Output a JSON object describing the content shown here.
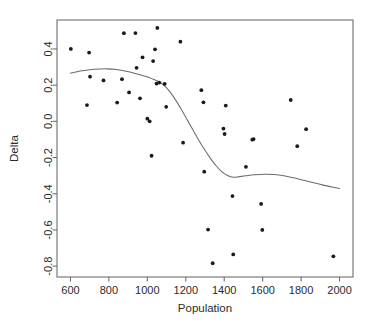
{
  "chart_data": {
    "type": "scatter",
    "title": "",
    "xlabel": "Population",
    "ylabel": "Delta",
    "xlim": [
      530,
      2070
    ],
    "ylim": [
      -0.86,
      0.56
    ],
    "grid": false,
    "legend": null,
    "xticks": [
      600,
      800,
      1000,
      1200,
      1400,
      1600,
      1800,
      2000
    ],
    "xtick_labels": [
      "600",
      "800",
      "1000",
      "1200",
      "1400",
      "1600",
      "1800",
      "2000"
    ],
    "yticks": [
      0.4,
      0.2,
      0.0,
      -0.2,
      -0.4,
      -0.6,
      -0.8
    ],
    "ytick_labels": [
      "0.4",
      "0.2",
      "0.0",
      "-0.2",
      "-0.4",
      "-0.6",
      "-0.8"
    ],
    "point_color": "#1a1a1a",
    "curve_color": "#6b6b6b",
    "frame_color": "#6e6e6e",
    "points": [
      {
        "x": 602,
        "y": 0.4
      },
      {
        "x": 686,
        "y": 0.09
      },
      {
        "x": 697,
        "y": 0.38
      },
      {
        "x": 702,
        "y": 0.247
      },
      {
        "x": 772,
        "y": 0.226
      },
      {
        "x": 843,
        "y": 0.104
      },
      {
        "x": 868,
        "y": 0.233
      },
      {
        "x": 878,
        "y": 0.487
      },
      {
        "x": 905,
        "y": 0.16
      },
      {
        "x": 938,
        "y": 0.488
      },
      {
        "x": 944,
        "y": 0.296
      },
      {
        "x": 962,
        "y": 0.127
      },
      {
        "x": 975,
        "y": 0.354
      },
      {
        "x": 1000,
        "y": 0.015
      },
      {
        "x": 1012,
        "y": 0.0
      },
      {
        "x": 1022,
        "y": -0.19
      },
      {
        "x": 1030,
        "y": 0.333
      },
      {
        "x": 1040,
        "y": 0.398
      },
      {
        "x": 1048,
        "y": 0.209
      },
      {
        "x": 1052,
        "y": 0.516
      },
      {
        "x": 1062,
        "y": 0.214
      },
      {
        "x": 1090,
        "y": 0.207
      },
      {
        "x": 1098,
        "y": 0.08
      },
      {
        "x": 1172,
        "y": 0.44
      },
      {
        "x": 1186,
        "y": -0.118
      },
      {
        "x": 1281,
        "y": 0.172
      },
      {
        "x": 1292,
        "y": 0.105
      },
      {
        "x": 1296,
        "y": -0.278
      },
      {
        "x": 1316,
        "y": -0.598
      },
      {
        "x": 1340,
        "y": -0.784
      },
      {
        "x": 1396,
        "y": -0.04
      },
      {
        "x": 1402,
        "y": -0.07
      },
      {
        "x": 1408,
        "y": 0.087
      },
      {
        "x": 1443,
        "y": -0.413
      },
      {
        "x": 1447,
        "y": -0.735
      },
      {
        "x": 1513,
        "y": -0.251
      },
      {
        "x": 1546,
        "y": -0.101
      },
      {
        "x": 1553,
        "y": -0.098
      },
      {
        "x": 1592,
        "y": -0.456
      },
      {
        "x": 1598,
        "y": -0.6
      },
      {
        "x": 1746,
        "y": 0.118
      },
      {
        "x": 1780,
        "y": -0.137
      },
      {
        "x": 1826,
        "y": -0.043
      },
      {
        "x": 1968,
        "y": -0.746
      }
    ],
    "loess_curve": [
      {
        "x": 600,
        "y": 0.266
      },
      {
        "x": 650,
        "y": 0.278
      },
      {
        "x": 700,
        "y": 0.285
      },
      {
        "x": 750,
        "y": 0.289
      },
      {
        "x": 790,
        "y": 0.29
      },
      {
        "x": 840,
        "y": 0.286
      },
      {
        "x": 890,
        "y": 0.277
      },
      {
        "x": 940,
        "y": 0.264
      },
      {
        "x": 990,
        "y": 0.249
      },
      {
        "x": 1030,
        "y": 0.233
      },
      {
        "x": 1060,
        "y": 0.219
      },
      {
        "x": 1090,
        "y": 0.196
      },
      {
        "x": 1120,
        "y": 0.16
      },
      {
        "x": 1150,
        "y": 0.113
      },
      {
        "x": 1180,
        "y": 0.06
      },
      {
        "x": 1210,
        "y": 0.004
      },
      {
        "x": 1240,
        "y": -0.052
      },
      {
        "x": 1270,
        "y": -0.108
      },
      {
        "x": 1300,
        "y": -0.16
      },
      {
        "x": 1330,
        "y": -0.207
      },
      {
        "x": 1360,
        "y": -0.248
      },
      {
        "x": 1390,
        "y": -0.28
      },
      {
        "x": 1415,
        "y": -0.298
      },
      {
        "x": 1440,
        "y": -0.308
      },
      {
        "x": 1470,
        "y": -0.307
      },
      {
        "x": 1510,
        "y": -0.301
      },
      {
        "x": 1560,
        "y": -0.295
      },
      {
        "x": 1610,
        "y": -0.292
      },
      {
        "x": 1660,
        "y": -0.294
      },
      {
        "x": 1710,
        "y": -0.301
      },
      {
        "x": 1760,
        "y": -0.312
      },
      {
        "x": 1810,
        "y": -0.325
      },
      {
        "x": 1860,
        "y": -0.338
      },
      {
        "x": 1910,
        "y": -0.351
      },
      {
        "x": 1960,
        "y": -0.363
      },
      {
        "x": 2000,
        "y": -0.371
      }
    ]
  },
  "plot_geometry": {
    "frame_left": 57,
    "frame_right": 353,
    "frame_top": 20,
    "frame_bottom": 277,
    "point_radius": 1.9
  }
}
